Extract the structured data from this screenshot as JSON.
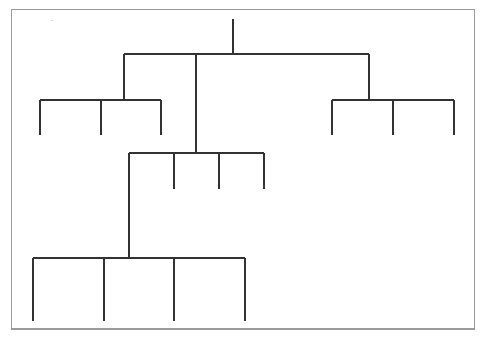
{
  "diagram": {
    "type": "tree",
    "line_color": "#333333",
    "frame_color": "#9a9a9a",
    "root": {
      "x": 233,
      "y_top": 19,
      "y_branch": 54
    },
    "levels": [
      {
        "id": "level-1",
        "bar": {
          "y": 54,
          "x1": 124,
          "x2": 369
        },
        "children_x": [
          124,
          196,
          369
        ]
      },
      {
        "id": "group-left",
        "parent_x": 124,
        "bar": {
          "y": 100,
          "x1": 40,
          "x2": 161
        },
        "leaves_x": [
          40,
          101,
          161
        ],
        "leaf_bottom": 135
      },
      {
        "id": "group-right",
        "parent_x": 369,
        "bar": {
          "y": 100,
          "x1": 332,
          "x2": 454
        },
        "leaves_x": [
          332,
          393,
          454
        ],
        "leaf_bottom": 135
      },
      {
        "id": "group-middle",
        "parent_x": 196,
        "bar": {
          "y": 153,
          "x1": 129,
          "x2": 264
        },
        "leaves_x": [
          174,
          219,
          264
        ],
        "leaf_bottom": 189,
        "branch_child_x": 129
      },
      {
        "id": "group-bottom",
        "parent_x": 129,
        "bar": {
          "y": 258,
          "x1": 33,
          "x2": 245
        },
        "leaves_x": [
          33,
          104,
          174,
          245
        ],
        "leaf_bottom": 321
      }
    ],
    "node_count": {
      "internal": 5,
      "leaves": 13
    }
  }
}
